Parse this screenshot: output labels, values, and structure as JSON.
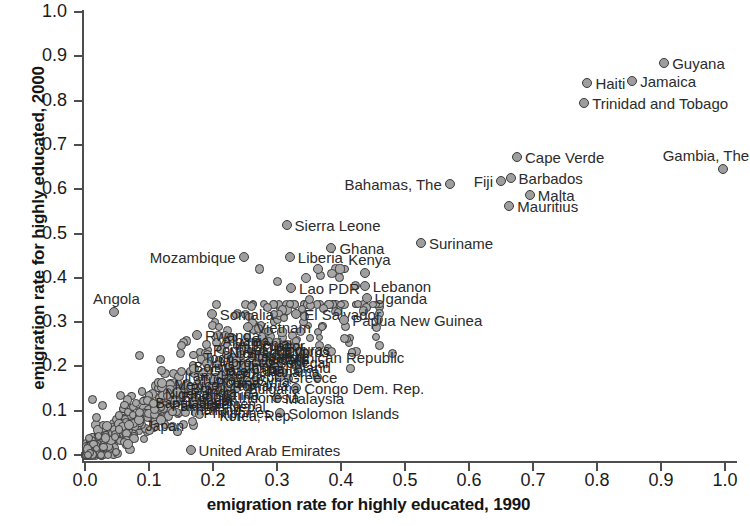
{
  "chart_data": {
    "type": "scatter",
    "title": "",
    "xlabel": "emigration rate for highly educated, 1990",
    "ylabel": "emigration rate for highly educated, 2000",
    "xlim": [
      0.0,
      1.0
    ],
    "ylim": [
      0.0,
      1.0
    ],
    "grid": false,
    "legend": null,
    "xticks": [
      "0.0",
      "0.1",
      "0.2",
      "0.3",
      "0.4",
      "0.5",
      "0.6",
      "0.7",
      "0.8",
      "0.9",
      "1.0"
    ],
    "yticks": [
      "0.0",
      "0.1",
      "0.2",
      "0.3",
      "0.4",
      "0.5",
      "0.6",
      "0.7",
      "0.8",
      "0.9",
      "1.0"
    ],
    "marker": {
      "shape": "circle",
      "fill": "#9e9e9e",
      "edge": "#3a3a3a"
    },
    "labeled_points": [
      {
        "name": "Guyana",
        "x": 0.905,
        "y": 0.885,
        "label_side": "right"
      },
      {
        "name": "Jamaica",
        "x": 0.855,
        "y": 0.845,
        "label_side": "right"
      },
      {
        "name": "Haiti",
        "x": 0.785,
        "y": 0.84,
        "label_side": "right"
      },
      {
        "name": "Trinidad and Tobago",
        "x": 0.78,
        "y": 0.795,
        "label_side": "right"
      },
      {
        "name": "Cape Verde",
        "x": 0.675,
        "y": 0.672,
        "label_side": "right"
      },
      {
        "name": "Gambia, The",
        "x": 0.997,
        "y": 0.645,
        "label_side": "above"
      },
      {
        "name": "Barbados",
        "x": 0.665,
        "y": 0.625,
        "label_side": "right"
      },
      {
        "name": "Fiji",
        "x": 0.65,
        "y": 0.618,
        "label_side": "left"
      },
      {
        "name": "Bahamas, The",
        "x": 0.57,
        "y": 0.612,
        "label_side": "left"
      },
      {
        "name": "Malta",
        "x": 0.695,
        "y": 0.588,
        "label_side": "right"
      },
      {
        "name": "Mauritius",
        "x": 0.663,
        "y": 0.563,
        "label_side": "right"
      },
      {
        "name": "Sierra Leone",
        "x": 0.315,
        "y": 0.52,
        "label_side": "right"
      },
      {
        "name": "Suriname",
        "x": 0.525,
        "y": 0.478,
        "label_side": "right"
      },
      {
        "name": "Ghana",
        "x": 0.385,
        "y": 0.468,
        "label_side": "right"
      },
      {
        "name": "Mozambique",
        "x": 0.248,
        "y": 0.448,
        "label_side": "left"
      },
      {
        "name": "Liberia",
        "x": 0.32,
        "y": 0.448,
        "label_side": "right"
      },
      {
        "name": "Kenya",
        "x": 0.437,
        "y": 0.41,
        "label_side": "above"
      },
      {
        "name": "Lebanon",
        "x": 0.437,
        "y": 0.382,
        "label_side": "right"
      },
      {
        "name": "Lao PDR",
        "x": 0.322,
        "y": 0.378,
        "label_side": "right"
      },
      {
        "name": "Uganda",
        "x": 0.44,
        "y": 0.355,
        "label_side": "right"
      },
      {
        "name": "Angola",
        "x": 0.045,
        "y": 0.322,
        "label_side": "above"
      },
      {
        "name": "Somalia",
        "x": 0.198,
        "y": 0.318,
        "label_side": "right"
      },
      {
        "name": "El Salvador",
        "x": 0.33,
        "y": 0.318,
        "label_side": "right"
      },
      {
        "name": "Papua New Guinea",
        "x": 0.405,
        "y": 0.305,
        "label_side": "right"
      },
      {
        "name": "Vietnam",
        "x": 0.255,
        "y": 0.288,
        "label_side": "right"
      },
      {
        "name": "Rwanda",
        "x": 0.175,
        "y": 0.272,
        "label_side": "right"
      },
      {
        "name": "Dominican Republic",
        "x": 0.278,
        "y": 0.222,
        "label_side": "right"
      },
      {
        "name": "Ireland",
        "x": 0.3,
        "y": 0.198,
        "label_side": "right"
      },
      {
        "name": "Greece",
        "x": 0.305,
        "y": 0.175,
        "label_side": "right"
      },
      {
        "name": "Congo Dem. Rep.",
        "x": 0.33,
        "y": 0.152,
        "label_side": "right"
      },
      {
        "name": "Malaysia",
        "x": 0.3,
        "y": 0.128,
        "label_side": "right"
      },
      {
        "name": "Solomon Islands",
        "x": 0.305,
        "y": 0.095,
        "label_side": "right"
      },
      {
        "name": "United Arab Emirates",
        "x": 0.165,
        "y": 0.012,
        "label_side": "right"
      }
    ],
    "note": "Dense unlabeled cluster of several hundred country observations concentrated in the lower-left quadrant (x 0.0-0.35, y 0.0-0.30), trending along a positive diagonal."
  },
  "axes": {
    "x_title": "emigration rate for highly educated, 1990",
    "y_title": "emigration rate for highly educated, 2000",
    "x_ticks": [
      "0.0",
      "0.1",
      "0.2",
      "0.3",
      "0.4",
      "0.5",
      "0.6",
      "0.7",
      "0.8",
      "0.9",
      "1.0"
    ],
    "y_ticks": [
      "0.0",
      "0.1",
      "0.2",
      "0.3",
      "0.4",
      "0.5",
      "0.6",
      "0.7",
      "0.8",
      "0.9",
      "1.0"
    ]
  }
}
